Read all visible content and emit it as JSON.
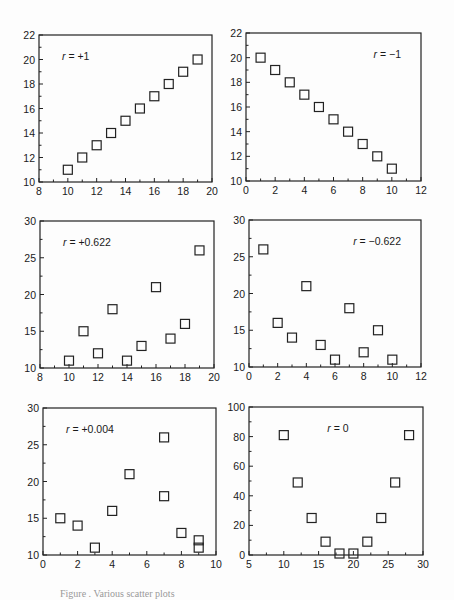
{
  "chart_data": [
    {
      "type": "scatter",
      "title": "",
      "annotation": "r = +1",
      "annotation_pos": "top-left",
      "x": [
        10,
        11,
        12,
        13,
        14,
        15,
        16,
        17,
        18,
        19
      ],
      "y": [
        11,
        12,
        13,
        14,
        15,
        16,
        17,
        18,
        19,
        20
      ],
      "xlim": [
        8,
        20
      ],
      "ylim": [
        10,
        22
      ],
      "xticks": [
        8,
        10,
        12,
        14,
        16,
        18,
        20
      ],
      "yticks": [
        10,
        12,
        14,
        16,
        18,
        20,
        22
      ],
      "xlabel": "",
      "ylabel": "",
      "grid": false,
      "marker": "open-square",
      "frame": [
        39,
        35,
        212,
        182
      ]
    },
    {
      "type": "scatter",
      "title": "",
      "annotation": "r = −1",
      "annotation_pos": "top-right",
      "x": [
        1,
        2,
        3,
        4,
        5,
        6,
        7,
        8,
        9,
        10
      ],
      "y": [
        20,
        19,
        18,
        17,
        16,
        15,
        14,
        13,
        12,
        11
      ],
      "xlim": [
        0,
        12
      ],
      "ylim": [
        10,
        22
      ],
      "xticks": [
        0,
        2,
        4,
        6,
        8,
        10,
        12
      ],
      "yticks": [
        10,
        12,
        14,
        16,
        18,
        20,
        22
      ],
      "xlabel": "",
      "ylabel": "",
      "grid": false,
      "marker": "open-square",
      "frame": [
        246,
        33,
        421,
        181
      ]
    },
    {
      "type": "scatter",
      "title": "",
      "annotation": "r = +0.622",
      "annotation_pos": "top-left",
      "x": [
        10,
        11,
        12,
        13,
        14,
        15,
        16,
        17,
        18,
        19
      ],
      "y": [
        11,
        15,
        12,
        18,
        11,
        13,
        21,
        14,
        16,
        26
      ],
      "xlim": [
        8,
        20
      ],
      "ylim": [
        10,
        30
      ],
      "xticks": [
        8,
        10,
        12,
        14,
        16,
        18,
        20
      ],
      "yticks": [
        10,
        15,
        20,
        25,
        30
      ],
      "xlabel": "",
      "ylabel": "",
      "grid": false,
      "marker": "open-square",
      "frame": [
        40,
        221,
        214,
        368
      ]
    },
    {
      "type": "scatter",
      "title": "",
      "annotation": "r = −0.622",
      "annotation_pos": "top-right",
      "x": [
        1,
        2,
        3,
        4,
        5,
        6,
        7,
        8,
        9,
        10
      ],
      "y": [
        26,
        16,
        14,
        21,
        13,
        11,
        18,
        12,
        15,
        11
      ],
      "xlim": [
        0,
        12
      ],
      "ylim": [
        10,
        30
      ],
      "xticks": [
        0,
        2,
        4,
        6,
        8,
        10,
        12
      ],
      "yticks": [
        10,
        15,
        20,
        25,
        30
      ],
      "xlabel": "",
      "ylabel": "",
      "grid": false,
      "marker": "open-square",
      "frame": [
        249,
        220,
        421,
        367
      ]
    },
    {
      "type": "scatter",
      "title": "",
      "annotation": "r = +0.004",
      "annotation_pos": "top-left",
      "x": [
        1,
        2,
        3,
        4,
        5,
        7,
        7,
        8,
        9,
        9
      ],
      "y": [
        15,
        14,
        11,
        16,
        21,
        26,
        18,
        13,
        12,
        11
      ],
      "xlim": [
        0,
        10
      ],
      "ylim": [
        10,
        30
      ],
      "xticks": [
        0,
        2,
        4,
        6,
        8,
        10
      ],
      "yticks": [
        10,
        15,
        20,
        25,
        30
      ],
      "xlabel": "",
      "ylabel": "",
      "grid": false,
      "marker": "open-square",
      "frame": [
        43,
        408,
        216,
        555
      ]
    },
    {
      "type": "scatter",
      "title": "",
      "annotation": "r = 0",
      "annotation_pos": "top-center",
      "x": [
        10,
        12,
        14,
        16,
        18,
        20,
        22,
        24,
        26,
        28
      ],
      "y": [
        81,
        49,
        25,
        9,
        1,
        1,
        9,
        25,
        49,
        81
      ],
      "xlim": [
        5,
        30
      ],
      "ylim": [
        0,
        100
      ],
      "xticks": [
        5,
        10,
        15,
        20,
        25,
        30
      ],
      "yticks": [
        0,
        20,
        40,
        60,
        80,
        100
      ],
      "xlabel": "",
      "ylabel": "",
      "grid": false,
      "marker": "open-square",
      "frame": [
        249,
        407,
        423,
        555
      ]
    }
  ],
  "caption": "Figure .  Various scatter plots"
}
